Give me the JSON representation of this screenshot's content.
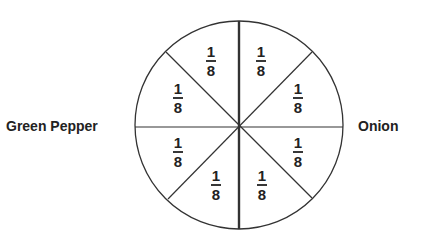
{
  "diagram": {
    "type": "fraction-circle",
    "left_label": "Green Pepper",
    "right_label": "Onion",
    "slices": [
      {
        "numerator": "1",
        "denominator": "8"
      },
      {
        "numerator": "1",
        "denominator": "8"
      },
      {
        "numerator": "1",
        "denominator": "8"
      },
      {
        "numerator": "1",
        "denominator": "8"
      },
      {
        "numerator": "1",
        "denominator": "8"
      },
      {
        "numerator": "1",
        "denominator": "8"
      },
      {
        "numerator": "1",
        "denominator": "8"
      },
      {
        "numerator": "1",
        "denominator": "8"
      }
    ],
    "colors": {
      "stroke": "#333333",
      "text": "#222222",
      "background": "#ffffff"
    }
  }
}
